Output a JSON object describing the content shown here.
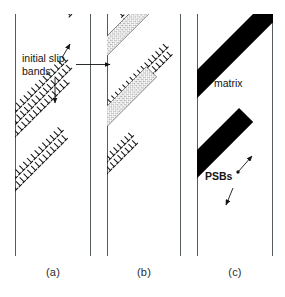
{
  "figure": {
    "background_color": "#ffffff",
    "ink_color": "#141414",
    "grain_boundary_color": "#555c60",
    "psb_color": "#000000"
  },
  "panels": [
    {
      "id": "a",
      "caption": "(a)",
      "stage": "initial slip bands",
      "left": 15,
      "right": 90,
      "band_style": "dislocation-ticks",
      "band_count": 3
    },
    {
      "id": "b",
      "caption": "(b)",
      "stage": "mixed dislocation and developing persistent slip bands",
      "left": 107,
      "right": 180,
      "band_style": "mixed-ticks-and-stipple",
      "band_count": 5
    },
    {
      "id": "c",
      "caption": "(c)",
      "stage": "fully formed persistent slip bands",
      "left": 197,
      "right": 272,
      "band_style": "solid-black",
      "band_count": 3
    }
  ],
  "annotations": {
    "initial_slip_bands": {
      "line1": "initial slip",
      "line2": "bands",
      "x": 22,
      "y": 57
    },
    "matrix": {
      "text": "matrix",
      "x": 214,
      "y": 77
    },
    "psbs": {
      "text": "PSBs",
      "x": 213,
      "y": 176
    }
  },
  "captions": {
    "a": "(a)",
    "b": "(b)",
    "c": "(c)"
  }
}
